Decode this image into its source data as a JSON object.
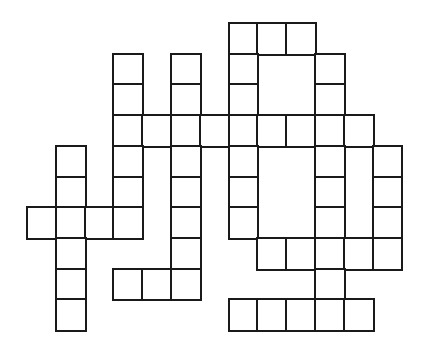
{
  "puzzle": {
    "type": "crossword-grid",
    "rows": 10,
    "cols": 13,
    "origin": {
      "x": 27,
      "y": 23
    },
    "cell_width": 28.8,
    "cell_height": 30.7,
    "line_color": "#1a1a1a",
    "fill_color": "#ffffff",
    "cells": [
      [
        0,
        7
      ],
      [
        0,
        8
      ],
      [
        0,
        9
      ],
      [
        1,
        3
      ],
      [
        1,
        5
      ],
      [
        1,
        7
      ],
      [
        1,
        10
      ],
      [
        2,
        3
      ],
      [
        2,
        5
      ],
      [
        2,
        7
      ],
      [
        2,
        10
      ],
      [
        3,
        3
      ],
      [
        3,
        4
      ],
      [
        3,
        5
      ],
      [
        3,
        6
      ],
      [
        3,
        7
      ],
      [
        3,
        8
      ],
      [
        3,
        9
      ],
      [
        3,
        10
      ],
      [
        3,
        11
      ],
      [
        4,
        1
      ],
      [
        4,
        3
      ],
      [
        4,
        5
      ],
      [
        4,
        7
      ],
      [
        4,
        10
      ],
      [
        4,
        12
      ],
      [
        5,
        1
      ],
      [
        5,
        3
      ],
      [
        5,
        5
      ],
      [
        5,
        7
      ],
      [
        5,
        10
      ],
      [
        5,
        12
      ],
      [
        6,
        0
      ],
      [
        6,
        1
      ],
      [
        6,
        2
      ],
      [
        6,
        3
      ],
      [
        6,
        5
      ],
      [
        6,
        7
      ],
      [
        6,
        10
      ],
      [
        6,
        12
      ],
      [
        7,
        1
      ],
      [
        7,
        5
      ],
      [
        7,
        8
      ],
      [
        7,
        9
      ],
      [
        7,
        10
      ],
      [
        7,
        11
      ],
      [
        7,
        12
      ],
      [
        8,
        1
      ],
      [
        8,
        3
      ],
      [
        8,
        4
      ],
      [
        8,
        5
      ],
      [
        8,
        10
      ],
      [
        9,
        1
      ],
      [
        9,
        7
      ],
      [
        9,
        8
      ],
      [
        9,
        9
      ],
      [
        9,
        10
      ],
      [
        9,
        11
      ]
    ]
  }
}
